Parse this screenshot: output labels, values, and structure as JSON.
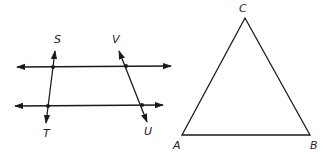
{
  "figures": {
    "parallel_lines": {
      "description": "Two parallel horizontal lines cut by two transversals ST and VU",
      "labels": {
        "S": "S",
        "T": "T",
        "V": "V",
        "U": "U"
      }
    },
    "triangle": {
      "description": "Triangle ABC",
      "labels": {
        "A": "A",
        "B": "B",
        "C": "C"
      }
    }
  },
  "colors": {
    "stroke": "#1a1a1a",
    "background": "#ffffff"
  }
}
